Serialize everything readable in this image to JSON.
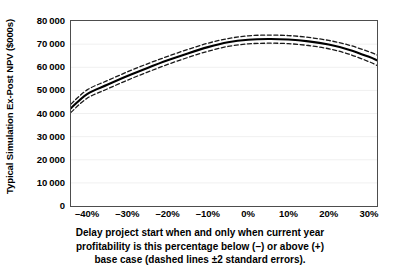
{
  "chart_data": {
    "type": "line",
    "title": "",
    "xlabel": "Delay project start when and only when current year profitability is this percentage below (–) or above (+) base case (dashed lines ±2 standard errors).",
    "ylabel": "Typical Simulation Ex-Post NPV ($000s)",
    "xlim": [
      -44,
      32
    ],
    "ylim": [
      0,
      80000
    ],
    "grid": true,
    "legend_position": "none",
    "x_tick_labels": [
      "–40%",
      "–30%",
      "–20%",
      "–10%",
      "0%",
      "10%",
      "20%",
      "30%"
    ],
    "x_tick_values": [
      -40,
      -30,
      -20,
      -10,
      0,
      10,
      20,
      30
    ],
    "y_tick_labels": [
      "0",
      "10 000",
      "20 000",
      "30 000",
      "40 000",
      "50 000",
      "60 000",
      "70 000",
      "80 000"
    ],
    "y_tick_values": [
      0,
      10000,
      20000,
      30000,
      40000,
      50000,
      60000,
      70000,
      80000
    ],
    "x": [
      -44,
      -40,
      -35,
      -30,
      -25,
      -20,
      -15,
      -10,
      -5,
      0,
      5,
      10,
      15,
      20,
      25,
      30,
      32
    ],
    "series": [
      {
        "name": "Mean ex-post NPV",
        "style": "solid",
        "color": "#000000",
        "values": [
          42300,
          48400,
          52400,
          56200,
          59700,
          63000,
          66000,
          68700,
          70800,
          71900,
          72200,
          72000,
          71200,
          69800,
          67600,
          64500,
          63000
        ]
      },
      {
        "name": "Upper bound (+2 standard errors)",
        "style": "dashed",
        "color": "#1a1a1a",
        "values": [
          44100,
          50200,
          54200,
          58000,
          61500,
          64700,
          67700,
          70400,
          72400,
          73600,
          73900,
          73700,
          72900,
          71600,
          69600,
          66700,
          65300
        ]
      },
      {
        "name": "Lower bound (–2 standard errors)",
        "style": "dashed",
        "color": "#1a1a1a",
        "values": [
          40500,
          46600,
          50600,
          54400,
          57900,
          61200,
          64200,
          66900,
          69000,
          70100,
          70400,
          70200,
          69400,
          68000,
          65700,
          62400,
          60800
        ]
      }
    ]
  }
}
